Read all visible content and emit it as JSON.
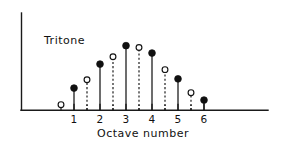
{
  "chart_data": {
    "type": "scatter",
    "title": "",
    "annotation": "Tritone",
    "xlabel": "Octave number",
    "ylabel": "",
    "xlim": [
      0.3,
      6.7
    ],
    "ylim": [
      0,
      1.05
    ],
    "grid": false,
    "legend_position": "none",
    "xticks": [
      1,
      2,
      3,
      4,
      5,
      6
    ],
    "xtick_labels": [
      "1",
      "2",
      "3",
      "4",
      "5",
      "6"
    ],
    "yticks": [],
    "ytick_labels": [],
    "series": [
      {
        "name": "integer-octave",
        "marker": "filled-circle",
        "stem_style": "solid",
        "x": [
          1,
          2,
          3,
          4,
          5,
          6
        ],
        "values": [
          0.24,
          0.5,
          0.7,
          0.62,
          0.34,
          0.11
        ]
      },
      {
        "name": "half-octave",
        "marker": "open-circle",
        "stem_style": "dashed",
        "x": [
          0.5,
          1.5,
          2.5,
          3.5,
          4.5,
          5.5
        ],
        "values": [
          0.06,
          0.33,
          0.58,
          0.68,
          0.44,
          0.19
        ]
      }
    ]
  },
  "figure": {
    "annotation_label": "Tritone",
    "xaxis_title": "Octave number",
    "tick_labels": [
      "1",
      "2",
      "3",
      "4",
      "5",
      "6"
    ],
    "colors": {
      "ink": "#111111",
      "background": "#ffffff"
    }
  }
}
